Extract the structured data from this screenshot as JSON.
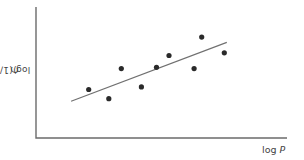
{
  "chart_data": {
    "type": "scatter",
    "title": "",
    "xlabel": "log P",
    "ylabel": "log (1/C)",
    "xlabel_parts": {
      "text": "log ",
      "var": "P"
    },
    "ylabel_parts": {
      "text": "log (1/",
      "var": "C",
      "close": ")"
    },
    "grid": false,
    "legend": null,
    "ticks": "none",
    "note": "Unscaled schematic axes; values in relative units (0-100) estimated from pixel positions",
    "xlim": [
      0,
      100
    ],
    "ylim": [
      0,
      100
    ],
    "points": [
      {
        "x": 21,
        "y": 37
      },
      {
        "x": 29,
        "y": 30
      },
      {
        "x": 34,
        "y": 53
      },
      {
        "x": 42,
        "y": 39
      },
      {
        "x": 48,
        "y": 54
      },
      {
        "x": 53,
        "y": 63
      },
      {
        "x": 63,
        "y": 53
      },
      {
        "x": 66,
        "y": 77
      },
      {
        "x": 75,
        "y": 65
      }
    ],
    "trendline": {
      "type": "linear",
      "start": {
        "x": 14,
        "y": 28
      },
      "end": {
        "x": 76,
        "y": 73
      }
    }
  },
  "colors": {
    "axis": "#6b6b6b",
    "line": "#707070",
    "point": "#2a2a2a",
    "text": "#444444"
  }
}
